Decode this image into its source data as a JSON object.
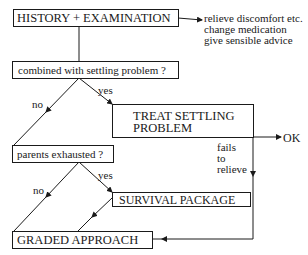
{
  "diagram": {
    "boxes": {
      "history": "HISTORY + EXAMINATION",
      "combined": "combined with settling problem ?",
      "treat_line1": "TREAT SETTLING",
      "treat_line2": "PROBLEM",
      "parents": "parents exhausted ?",
      "survival": "SURVIVAL PACKAGE",
      "graded": "GRADED APPROACH"
    },
    "side_notes": [
      "relieve discomfort etc.",
      "change medication",
      "give sensible advice"
    ],
    "labels": {
      "no_1": "no",
      "yes_1": "yes",
      "no_2": "no",
      "yes_2": "yes",
      "ok": "OK",
      "fails": [
        "fails",
        "to",
        "relieve"
      ]
    },
    "colors": {
      "line": "#1a1a1a",
      "background": "#ffffff"
    }
  }
}
